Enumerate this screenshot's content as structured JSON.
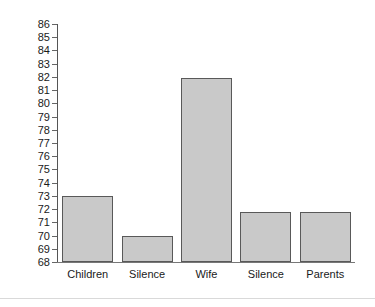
{
  "chart_data": {
    "type": "bar",
    "title": "",
    "subtitle": "",
    "xlabel": "",
    "ylabel": "",
    "categories": [
      "Children",
      "Silence",
      "Wife",
      "Silence",
      "Parents"
    ],
    "values": [
      73,
      70,
      81.9,
      71.8,
      71.8
    ],
    "series": [
      {
        "name": "",
        "values": [
          73,
          70,
          81.9,
          71.8,
          71.8
        ]
      }
    ],
    "ylim": [
      68,
      86
    ],
    "yticks": [
      68,
      69,
      70,
      71,
      72,
      73,
      74,
      75,
      76,
      77,
      78,
      79,
      80,
      81,
      82,
      83,
      84,
      85,
      86
    ],
    "ytick_labels": [
      "68",
      "69",
      "70",
      "71",
      "72",
      "73",
      "74",
      "75",
      "76",
      "77",
      "78",
      "79",
      "80",
      "81",
      "82",
      "83",
      "84",
      "85",
      "86"
    ],
    "grid": false,
    "legend": null,
    "legend_position": "none",
    "annotations": [],
    "colors": {
      "bar_fill": "#c9c9c9",
      "bar_edge": "#595959",
      "axis": "#555555",
      "text": "#1a1a1a",
      "background": "#ffffff",
      "divider": "#d9d9d9"
    }
  }
}
